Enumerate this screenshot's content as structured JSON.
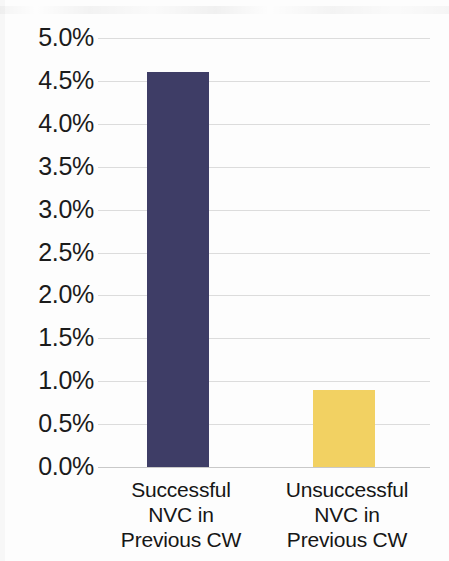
{
  "chart_data": {
    "type": "bar",
    "title": "",
    "subtitle": "",
    "xlabel": "",
    "ylabel": "",
    "categories": [
      "Successful\nNVC in\nPrevious CW",
      "Unsuccessful\nNVC in\nPrevious CW"
    ],
    "category_lines": [
      [
        "Successful",
        "NVC in",
        "Previous CW"
      ],
      [
        "Unsuccessful",
        "NVC in",
        "Previous CW"
      ]
    ],
    "values": [
      4.6,
      0.9
    ],
    "value_labels": [
      "4.6%",
      "0.9%"
    ],
    "bar_colors": [
      "#3e3d66",
      "#f2d162"
    ],
    "ylim": [
      0.0,
      5.0
    ],
    "ytick_values": [
      5.0,
      4.5,
      4.0,
      3.5,
      3.0,
      2.5,
      2.0,
      1.5,
      1.0,
      0.5,
      0.0
    ],
    "ytick_labels": [
      "5.0%",
      "4.5%",
      "4.0%",
      "3.5%",
      "3.0%",
      "2.5%",
      "2.0%",
      "1.5%",
      "1.0%",
      "0.5%",
      "0.0%"
    ],
    "grid": true,
    "grid_color": "#dcdcdc",
    "legend": false,
    "legend_position": "none",
    "background_color": "#fdfdfd",
    "tick_suffix": "%"
  }
}
